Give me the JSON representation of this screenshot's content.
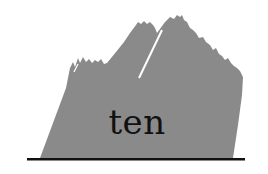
{
  "logo": {
    "word": "ten",
    "colors": {
      "mountain_fill": "#8a8a8a",
      "crack": "#ffffff",
      "baseline": "#111111",
      "text": "#111111",
      "background": "#ffffff"
    },
    "icons": [
      "mountain-icon"
    ]
  }
}
